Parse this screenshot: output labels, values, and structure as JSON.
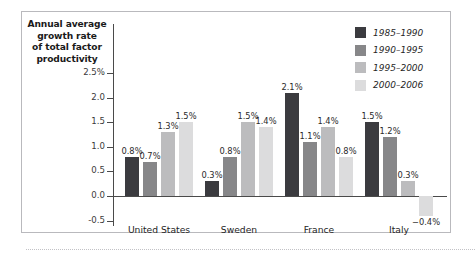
{
  "chart_data": {
    "type": "bar",
    "title": "Annual average growth rate of total factor productivity",
    "title_lines": [
      "Annual average",
      "growth rate",
      "of total factor",
      "productivity"
    ],
    "xlabel": "",
    "ylabel": "Annual average growth rate of total factor productivity",
    "ylim": [
      -0.5,
      2.75
    ],
    "ytick_labels": [
      "2.5%",
      "2.0",
      "1.5",
      "1.0",
      "0.5",
      "0.0",
      "-0.5"
    ],
    "ytick_values": [
      2.5,
      2.0,
      1.5,
      1.0,
      0.5,
      0.0,
      -0.5
    ],
    "grid": false,
    "legend_position": "top-right",
    "categories": [
      "United States",
      "Sweden",
      "France",
      "Italy"
    ],
    "series": [
      {
        "name": "1985–1990",
        "color": "#3b3b3f",
        "values": [
          0.8,
          0.3,
          2.1,
          1.5
        ],
        "labels": [
          "0.8%",
          "0.3%",
          "2.1%",
          "1.5%"
        ]
      },
      {
        "name": "1990–1995",
        "color": "#878789",
        "values": [
          0.7,
          0.8,
          1.1,
          1.2
        ],
        "labels": [
          "0.7%",
          "0.8%",
          "1.1%",
          "1.2%"
        ]
      },
      {
        "name": "1995–2000",
        "color": "#bcbcbe",
        "values": [
          1.3,
          1.5,
          1.4,
          0.3
        ],
        "labels": [
          "1.3%",
          "1.5%",
          "1.4%",
          "0.3%"
        ]
      },
      {
        "name": "2000–2006",
        "color": "#dcdcdd",
        "values": [
          1.5,
          1.4,
          0.8,
          -0.4
        ],
        "labels": [
          "1.5%",
          "1.4%",
          "0.8%",
          "−0.4%"
        ]
      }
    ]
  },
  "colors": {
    "frame_border": "#b9b9bd",
    "axis_line": "#4a4a4a",
    "text": "#1a1a1a",
    "background": "#ffffff"
  }
}
